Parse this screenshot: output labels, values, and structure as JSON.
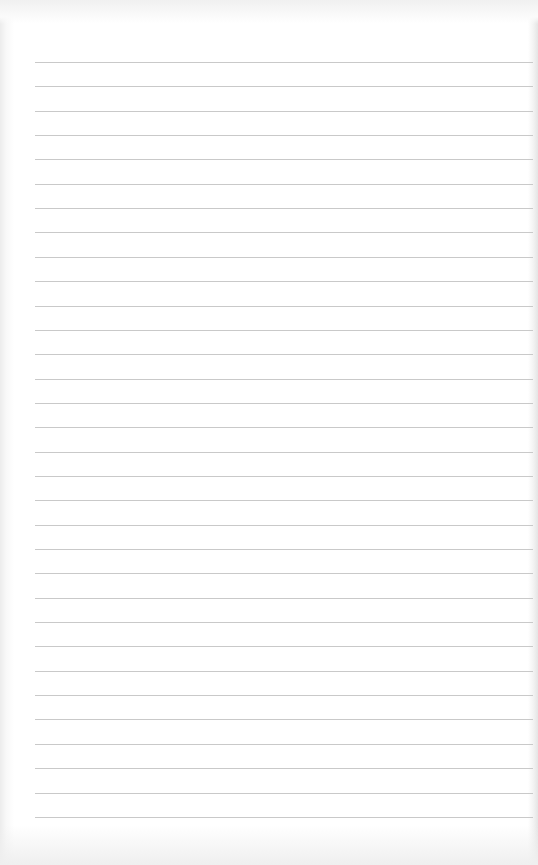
{
  "page": {
    "type": "lined-paper",
    "background_color": "#ffffff",
    "rule_color": "#c9c9c9",
    "rule_count": 32,
    "first_rule_y": 62,
    "rule_spacing": 24.35,
    "rule_left": 35,
    "rule_width": 498
  }
}
